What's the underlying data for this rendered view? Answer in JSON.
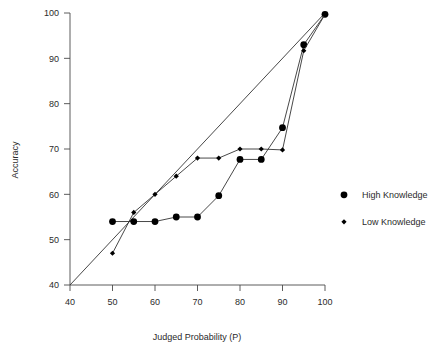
{
  "chart_data": {
    "type": "line",
    "title": "",
    "subtitle": "",
    "xlabel": "Judged Probability (P)",
    "ylabel": "Accuracy",
    "xlim": [
      40,
      100
    ],
    "ylim": [
      40,
      100
    ],
    "xticks": [
      40,
      50,
      60,
      70,
      80,
      90,
      100
    ],
    "yticks": [
      40,
      50,
      60,
      70,
      80,
      90,
      100
    ],
    "xtick_labels": [
      "40",
      "50",
      "60",
      "70",
      "80",
      "90",
      "100"
    ],
    "ytick_labels": [
      "40",
      "50",
      "60",
      "70",
      "80",
      "90",
      "100"
    ],
    "grid": false,
    "legend_position": "right",
    "x": [
      50,
      55,
      60,
      65,
      70,
      75,
      80,
      85,
      90,
      95,
      100
    ],
    "series": [
      {
        "name": "High Knowledge",
        "marker": "circle",
        "values": [
          54.0,
          54.0,
          54.0,
          55.0,
          55.0,
          59.7,
          67.7,
          67.7,
          74.7,
          93.0,
          99.7
        ]
      },
      {
        "name": "Low Knowledge",
        "marker": "diamond",
        "values": [
          47.0,
          56.0,
          60.0,
          64.0,
          68.0,
          68.0,
          70.0,
          70.0,
          69.8,
          91.7,
          99.7
        ]
      }
    ],
    "annotations": [
      {
        "name": "identity-reference-line",
        "description": "diagonal perfect-calibration line",
        "from": [
          40,
          40
        ],
        "to": [
          100,
          100
        ]
      }
    ],
    "colors": {
      "marker": "#000000",
      "line": "#333333",
      "axis": "#4a4a4a",
      "text": "#2b2b2b",
      "background": "#ffffff"
    }
  },
  "legend": {
    "entries": [
      {
        "label": "High Knowledge",
        "marker": "circle"
      },
      {
        "label": "Low Knowledge",
        "marker": "diamond"
      }
    ]
  }
}
